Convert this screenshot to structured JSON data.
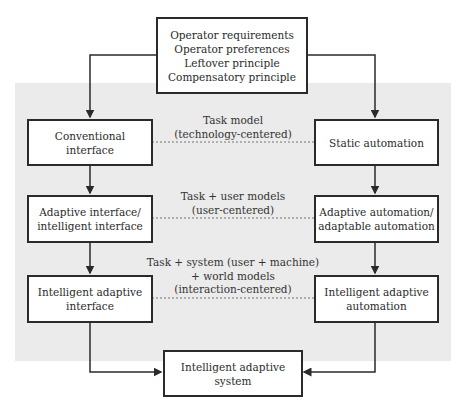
{
  "diagram": {
    "top_box": {
      "lines": [
        "Operator requirements",
        "Operator preferences",
        "Leftover principle",
        "Compensatory principle"
      ]
    },
    "left_column": [
      {
        "lines": [
          "Conventional",
          "interface"
        ]
      },
      {
        "lines": [
          "Adaptive interface/",
          "intelligent interface"
        ]
      },
      {
        "lines": [
          "Intelligent adaptive",
          "interface"
        ]
      }
    ],
    "right_column": [
      {
        "lines": [
          "Static automation"
        ]
      },
      {
        "lines": [
          "Adaptive automation/",
          "adaptable automation"
        ]
      },
      {
        "lines": [
          "Intelligent adaptive",
          "automation"
        ]
      }
    ],
    "links": [
      {
        "lines": [
          "Task model",
          "(technology-centered)"
        ]
      },
      {
        "lines": [
          "Task + user models",
          "(user-centered)"
        ]
      },
      {
        "lines": [
          "Task + system (user + machine)",
          "+ world models",
          "(interaction-centered)"
        ]
      }
    ],
    "bottom_box": {
      "lines": [
        "Intelligent adaptive",
        "system"
      ]
    },
    "colors": {
      "line": "#2a2a2a",
      "panel": "#ebebeb",
      "box_fill": "#ffffff"
    }
  }
}
